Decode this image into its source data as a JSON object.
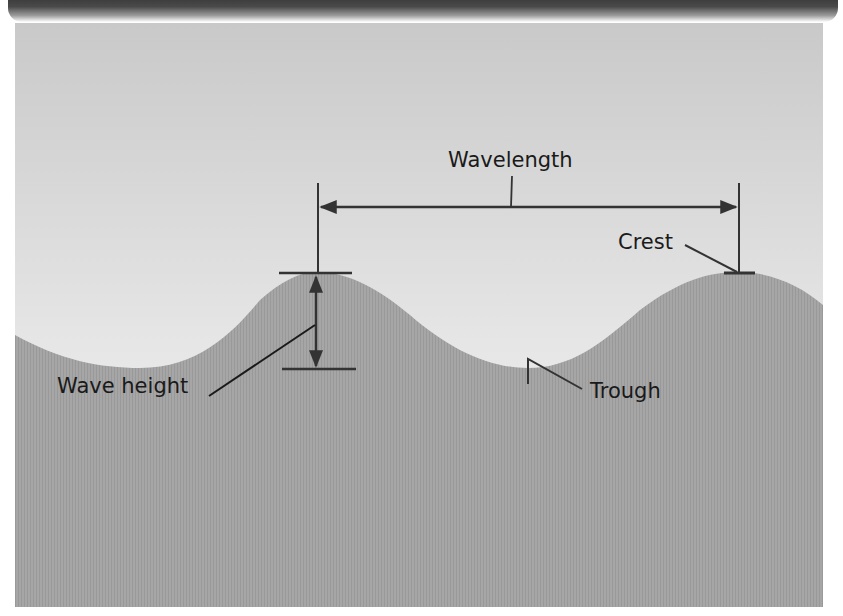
{
  "figure": {
    "labels": {
      "wavelength": "Wavelength",
      "crest": "Crest",
      "wave_height": "Wave height",
      "trough": "Trough"
    },
    "colors": {
      "top_bar": "#444444",
      "sky_top": "#c9c9c9",
      "sky_bottom": "#f1f1f1",
      "water": "#a4a4a4",
      "water_stripe": "#9a9a9a",
      "lines": "#333333"
    }
  }
}
